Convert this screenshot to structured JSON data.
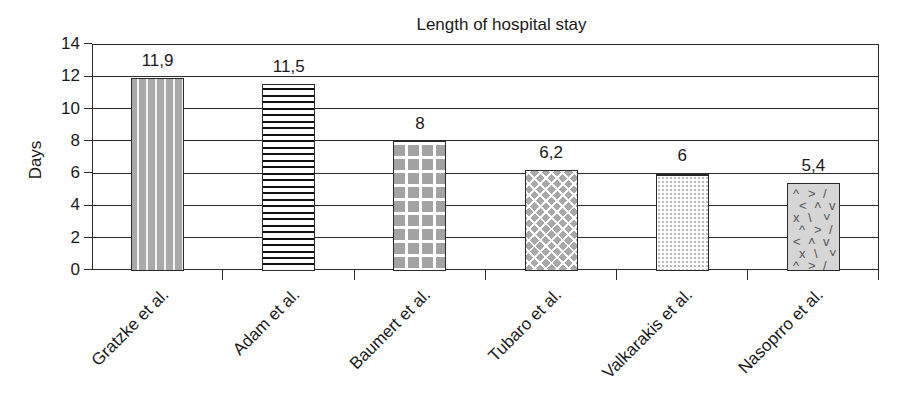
{
  "chart_data": {
    "type": "bar",
    "title": "Length of hospital stay",
    "xlabel": "",
    "ylabel": "Days",
    "ylim": [
      0,
      14
    ],
    "yticks": [
      0,
      2,
      4,
      6,
      8,
      10,
      12,
      14
    ],
    "grid": true,
    "legend": null,
    "categories": [
      "Gratzke et al.",
      "Adam et al.",
      "Baumert et al.",
      "Tubaro et al.",
      "Valkarakis et al.",
      "Nasoprro et al."
    ],
    "values": [
      11.9,
      11.5,
      8,
      6.2,
      6,
      5.4
    ],
    "data_labels": [
      "11,9",
      "11,5",
      "8",
      "6,2",
      "6",
      "5,4"
    ]
  },
  "ui": {
    "title": "Length of hospital stay",
    "y_title": "Days",
    "y_tick_labels": [
      "0",
      "2",
      "4",
      "6",
      "8",
      "10",
      "12",
      "14"
    ],
    "bars": [
      {
        "label": "Gratzke et al.",
        "value_label": "11,9",
        "pattern": "gratzke"
      },
      {
        "label": "Adam et al.",
        "value_label": "11,5",
        "pattern": "adam"
      },
      {
        "label": "Baumert et al.",
        "value_label": "8",
        "pattern": "baumert"
      },
      {
        "label": "Tubaro et al.",
        "value_label": "6,2",
        "pattern": "tubaro"
      },
      {
        "label": "Valkarakis et al.",
        "value_label": "6",
        "pattern": "valkarakis"
      },
      {
        "label": "Nasoprro et al.",
        "value_label": "5,4",
        "pattern": "nasoprro"
      }
    ]
  }
}
